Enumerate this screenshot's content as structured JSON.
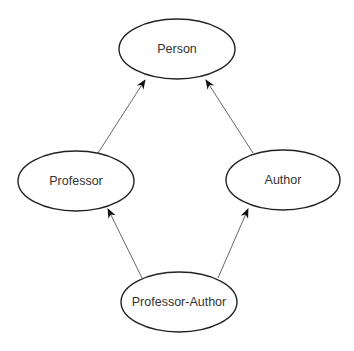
{
  "diagram": {
    "type": "inheritance-graph",
    "nodes": [
      {
        "id": "person",
        "label": "Person",
        "cx": 177,
        "cy": 49,
        "rx": 58,
        "ry": 30
      },
      {
        "id": "professor",
        "label": "Professor",
        "cx": 76,
        "cy": 181,
        "rx": 58,
        "ry": 30
      },
      {
        "id": "author",
        "label": "Author",
        "cx": 283,
        "cy": 180,
        "rx": 57,
        "ry": 30
      },
      {
        "id": "professor-author",
        "label": "Professor-Author",
        "cx": 179,
        "cy": 302,
        "rx": 58,
        "ry": 30
      }
    ],
    "edges": [
      {
        "from": "professor",
        "to": "person"
      },
      {
        "from": "author",
        "to": "person"
      },
      {
        "from": "professor-author",
        "to": "professor"
      },
      {
        "from": "professor-author",
        "to": "author"
      }
    ]
  }
}
